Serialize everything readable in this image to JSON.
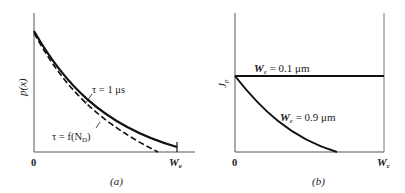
{
  "panel_a": {
    "caption": "(a)",
    "y_axis_label": "p(x)",
    "x_tick_start": "0",
    "x_tick_end": "W",
    "x_tick_end_sub": "e",
    "curve_solid_label": "τ = 1 μs",
    "curve_dashed_label_prefix": "τ = f(N",
    "curve_dashed_label_sub": "D",
    "curve_dashed_label_suffix": ")"
  },
  "panel_b": {
    "caption": "(b)",
    "y_axis_label": "J",
    "y_axis_label_sub": "p",
    "x_tick_start": "0",
    "x_tick_end": "W",
    "x_tick_end_sub": "c",
    "line_flat_label_prefix": "W",
    "line_flat_label_sub": "e",
    "line_flat_label_suffix": " = 0.1 μm",
    "curve_label_prefix": "W",
    "curve_label_sub": "e",
    "curve_label_suffix": " = 0.9 μm"
  },
  "colors": {
    "line": "#111111",
    "axis": "#555555"
  }
}
